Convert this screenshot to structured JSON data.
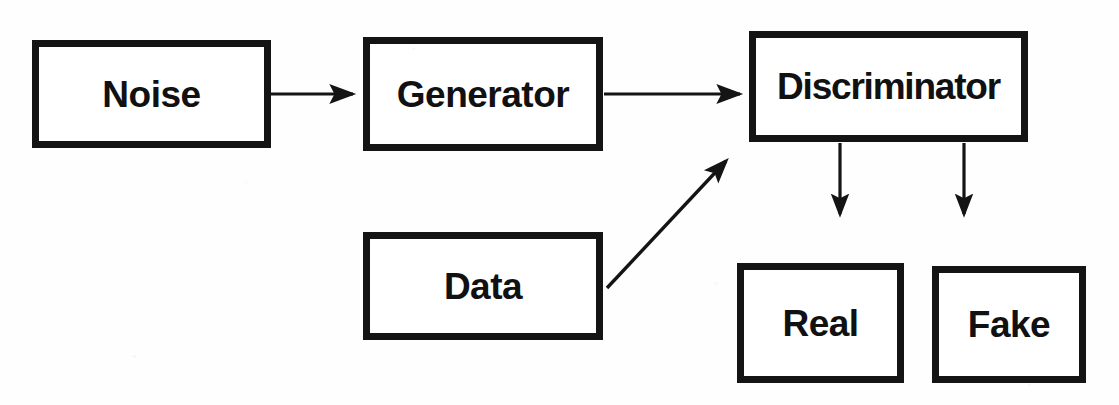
{
  "diagram": {
    "background_color": "#fefefe",
    "stroke_color": "#141414",
    "text_color": "#111111",
    "nodes": [
      {
        "id": "noise",
        "label": "Noise",
        "x": 32,
        "y": 40,
        "w": 239,
        "h": 108
      },
      {
        "id": "generator",
        "label": "Generator",
        "x": 363,
        "y": 37,
        "w": 240,
        "h": 114
      },
      {
        "id": "discriminator",
        "label": "Discriminator",
        "x": 749,
        "y": 31,
        "w": 279,
        "h": 111
      },
      {
        "id": "data",
        "label": "Data",
        "x": 363,
        "y": 232,
        "w": 240,
        "h": 108
      },
      {
        "id": "real",
        "label": "Real",
        "x": 737,
        "y": 263,
        "w": 167,
        "h": 120
      },
      {
        "id": "fake",
        "label": "Fake",
        "x": 932,
        "y": 266,
        "w": 154,
        "h": 117
      }
    ],
    "edges": [
      {
        "id": "noise-to-generator",
        "from": "noise",
        "to": "generator",
        "kind": "horizontal-arrow",
        "x1": 271,
        "y1": 94,
        "x2": 357,
        "y2": 94
      },
      {
        "id": "generator-to-discriminator",
        "from": "generator",
        "to": "discriminator",
        "kind": "horizontal-arrow",
        "x1": 604,
        "y1": 94,
        "x2": 744,
        "y2": 94
      },
      {
        "id": "data-to-discriminator",
        "from": "data",
        "to": "discriminator",
        "kind": "diagonal-arrow",
        "x1": 607,
        "y1": 288,
        "x2": 729,
        "y2": 157
      },
      {
        "id": "discriminator-to-real",
        "from": "discriminator",
        "to": "real",
        "kind": "vertical-arrow",
        "x1": 840,
        "y1": 143,
        "x2": 840,
        "y2": 220
      },
      {
        "id": "discriminator-to-fake",
        "from": "discriminator",
        "to": "fake",
        "kind": "vertical-arrow",
        "x1": 964,
        "y1": 143,
        "x2": 964,
        "y2": 220
      }
    ]
  }
}
